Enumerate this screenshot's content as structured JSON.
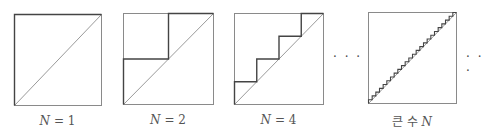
{
  "figure": {
    "colors": {
      "box": "#8a8a8a",
      "diagonal": "#9a9a9a",
      "staircase": "#444444",
      "caption": "#555555"
    },
    "panels": [
      {
        "id": "n1",
        "steps": 1,
        "caption_var": "N",
        "caption_rest": " = 1",
        "box": {
          "x": 14,
          "y": 14,
          "w": 87,
          "h": 91
        }
      },
      {
        "id": "n2",
        "steps": 2,
        "caption_var": "N",
        "caption_rest": " = 2",
        "box": {
          "x": 123,
          "y": 13,
          "w": 90,
          "h": 91
        }
      },
      {
        "id": "n4",
        "steps": 4,
        "caption_var": "N",
        "caption_rest": " = 4",
        "box": {
          "x": 234,
          "y": 13,
          "w": 89,
          "h": 91
        }
      },
      {
        "id": "nlarge",
        "steps": 24,
        "caption_prefix": "큰 수 ",
        "caption_var": "N",
        "caption_rest": "",
        "box": {
          "x": 368,
          "y": 12,
          "w": 88,
          "h": 91
        }
      }
    ],
    "ellipses": [
      {
        "text": "· · ·",
        "x": 333,
        "y": 50
      },
      {
        "text": "· · ·",
        "x": 466,
        "y": 50
      }
    ]
  }
}
